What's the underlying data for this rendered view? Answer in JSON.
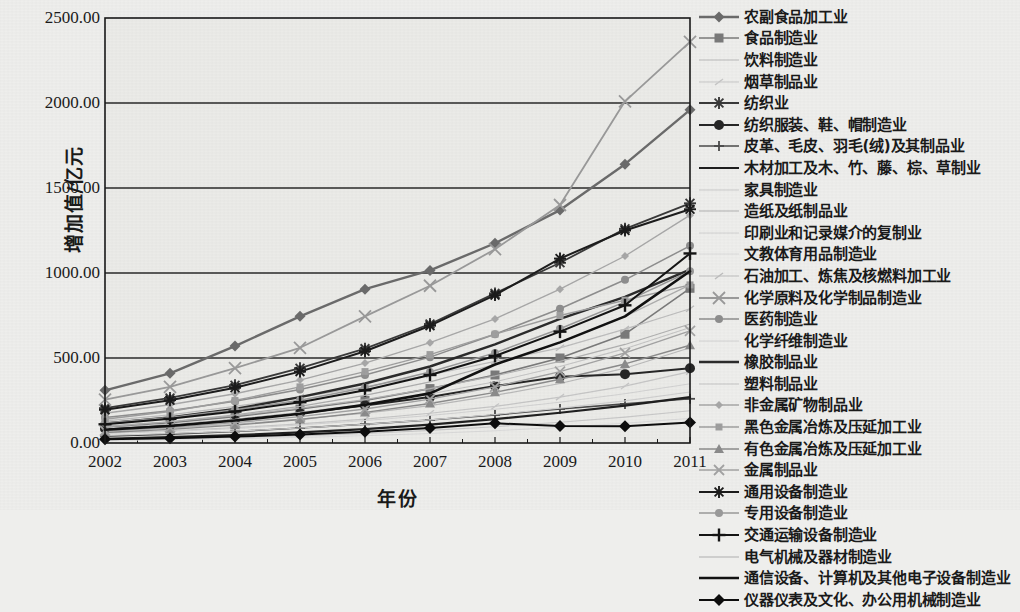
{
  "chart_data": {
    "type": "line",
    "title": "",
    "xlabel": "年份",
    "ylabel": "增加值/亿元",
    "grid": true,
    "legend_position": "right",
    "x": [
      "2002",
      "2003",
      "2004",
      "2005",
      "2006",
      "2007",
      "2008",
      "2009",
      "2010",
      "2011"
    ],
    "categories": [
      "2002",
      "2003",
      "2004",
      "2005",
      "2006",
      "2007",
      "2008",
      "2009",
      "2010",
      "2011"
    ],
    "xtick_labels": [
      "2002",
      "2003",
      "2004",
      "2005",
      "2006",
      "2007",
      "2008",
      "2009",
      "2010",
      "2011"
    ],
    "ytick_labels": [
      "0.00",
      "500.00",
      "1000.00",
      "1500.00",
      "2000.00",
      "2500.00"
    ],
    "ylim": [
      0,
      2500
    ],
    "ytick_values": [
      0,
      500,
      1000,
      1500,
      2000,
      2500
    ],
    "series": [
      {
        "name": "农副食品加工业",
        "marker": "diamond",
        "color": "#6b6b6b",
        "width": 2.4,
        "values": [
          310,
          410,
          570,
          745,
          905,
          1015,
          1175,
          1370,
          1640,
          1960
        ]
      },
      {
        "name": "食品制造业",
        "marker": "square",
        "color": "#7a7a7a",
        "width": 1.6,
        "values": [
          95,
          120,
          155,
          200,
          250,
          320,
          400,
          500,
          640,
          910
        ]
      },
      {
        "name": "饮料制造业",
        "marker": "none",
        "color": "#b9b9b9",
        "width": 1.2,
        "values": [
          70,
          88,
          110,
          140,
          175,
          220,
          280,
          350,
          440,
          560
        ]
      },
      {
        "name": "烟草制品业",
        "marker": "tick",
        "color": "#c6c6c6",
        "width": 1.2,
        "values": [
          60,
          72,
          90,
          112,
          140,
          175,
          215,
          270,
          335,
          420
        ]
      },
      {
        "name": "纺织业",
        "marker": "asterisk",
        "color": "#3a3a3a",
        "width": 1.8,
        "values": [
          205,
          265,
          340,
          440,
          555,
          700,
          880,
          1060,
          1260,
          1410
        ]
      },
      {
        "name": "纺织服装、鞋、帽制造业",
        "marker": "circle",
        "color": "#262626",
        "width": 2.0,
        "values": [
          85,
          105,
          135,
          175,
          220,
          270,
          335,
          390,
          405,
          440
        ]
      },
      {
        "name": "皮革、毛皮、羽毛(绒)及其制品业",
        "marker": "plus",
        "color": "#4a4a4a",
        "width": 1.6,
        "values": [
          40,
          52,
          68,
          88,
          110,
          135,
          165,
          200,
          230,
          260
        ]
      },
      {
        "name": "木材加工及木、竹、藤、棕、草制业",
        "marker": "none",
        "color": "#1f1f1f",
        "width": 2.2,
        "values": [
          25,
          34,
          46,
          62,
          82,
          108,
          140,
          178,
          220,
          270
        ]
      },
      {
        "name": "家具制造业",
        "marker": "none",
        "color": "#c9c9c9",
        "width": 1.1,
        "values": [
          18,
          24,
          32,
          42,
          56,
          74,
          96,
          122,
          152,
          190
        ]
      },
      {
        "name": "造纸及纸制品业",
        "marker": "none",
        "color": "#b0b0b0",
        "width": 1.1,
        "values": [
          100,
          125,
          160,
          205,
          255,
          320,
          395,
          480,
          580,
          700
        ]
      },
      {
        "name": "印刷业和记录媒介的复制业",
        "marker": "none",
        "color": "#cfcfcf",
        "width": 1.1,
        "values": [
          45,
          56,
          70,
          88,
          110,
          136,
          168,
          205,
          248,
          300
        ]
      },
      {
        "name": "文教体育用品制造业",
        "marker": "none",
        "color": "#dadada",
        "width": 1.0,
        "values": [
          15,
          19,
          25,
          33,
          43,
          56,
          72,
          92,
          116,
          145
        ]
      },
      {
        "name": "石油加工、炼焦及核燃料加工业",
        "marker": "tick",
        "color": "#bdbdbd",
        "width": 1.2,
        "values": [
          130,
          165,
          215,
          270,
          330,
          400,
          480,
          560,
          670,
          790
        ]
      },
      {
        "name": "化学原料及化学制品制造业",
        "marker": "cross",
        "color": "#9a9a9a",
        "width": 1.8,
        "values": [
          255,
          330,
          440,
          560,
          745,
          925,
          1140,
          1400,
          2010,
          2360
        ]
      },
      {
        "name": "医药制造业",
        "marker": "circle-sm",
        "color": "#8e8e8e",
        "width": 1.5,
        "values": [
          150,
          190,
          245,
          315,
          400,
          505,
          640,
          790,
          960,
          1160
        ]
      },
      {
        "name": "化学纤维制造业",
        "marker": "none",
        "color": "#d2d2d2",
        "width": 1.0,
        "values": [
          55,
          68,
          85,
          106,
          132,
          162,
          198,
          240,
          290,
          348
        ]
      },
      {
        "name": "橡胶制品业",
        "marker": "none",
        "color": "#2b2b2b",
        "width": 2.4,
        "values": [
          115,
          150,
          200,
          270,
          350,
          450,
          580,
          730,
          860,
          1020
        ]
      },
      {
        "name": "塑料制品业",
        "marker": "none",
        "color": "#c4c4c4",
        "width": 1.1,
        "values": [
          88,
          110,
          140,
          180,
          228,
          288,
          360,
          450,
          555,
          680
        ]
      },
      {
        "name": "非金属矿物制品业",
        "marker": "diamond-sm",
        "color": "#a8a8a8",
        "width": 1.4,
        "values": [
          175,
          225,
          290,
          370,
          470,
          590,
          730,
          905,
          1100,
          1340
        ]
      },
      {
        "name": "黑色金属冶炼及压延加工业",
        "marker": "square-sm",
        "color": "#9f9f9f",
        "width": 1.4,
        "values": [
          140,
          185,
          250,
          330,
          420,
          520,
          640,
          750,
          840,
          930
        ]
      },
      {
        "name": "有色金属冶炼及压延加工业",
        "marker": "triangle",
        "color": "#8b8b8b",
        "width": 1.4,
        "values": [
          62,
          80,
          105,
          138,
          180,
          232,
          298,
          375,
          465,
          575
        ]
      },
      {
        "name": "金属制品业",
        "marker": "x",
        "color": "#a3a3a3",
        "width": 1.4,
        "values": [
          72,
          92,
          120,
          155,
          200,
          258,
          330,
          420,
          530,
          660
        ]
      },
      {
        "name": "通用设备制造业",
        "marker": "asterisk",
        "color": "#1c1c1c",
        "width": 2.0,
        "values": [
          195,
          252,
          325,
          420,
          540,
          690,
          870,
          1085,
          1250,
          1375
        ]
      },
      {
        "name": "专用设备制造业",
        "marker": "circle-sm",
        "color": "#999999",
        "width": 1.5,
        "values": [
          118,
          150,
          195,
          252,
          325,
          418,
          530,
          672,
          830,
          1010
        ]
      },
      {
        "name": "交通运输设备制造业",
        "marker": "plus-lg",
        "color": "#141414",
        "width": 2.0,
        "values": [
          110,
          142,
          185,
          240,
          310,
          400,
          512,
          655,
          810,
          1115
        ]
      },
      {
        "name": "电气机械及器材制造业",
        "marker": "none",
        "color": "#adadad",
        "width": 1.2,
        "values": [
          95,
          125,
          165,
          215,
          280,
          360,
          462,
          592,
          745,
          930
        ]
      },
      {
        "name": "通信设备、计算机及其他电子设备制造业",
        "marker": "none",
        "color": "#111111",
        "width": 2.6,
        "values": [
          78,
          100,
          132,
          172,
          225,
          292,
          462,
          592,
          745,
          1010
        ]
      },
      {
        "name": "仪器仪表及文化、办公用机械制造业",
        "marker": "diamond-lg",
        "color": "#0d0d0d",
        "width": 2.0,
        "values": [
          22,
          28,
          38,
          50,
          66,
          88,
          116,
          100,
          98,
          120
        ]
      }
    ]
  },
  "legend": {
    "items": [
      {
        "label": "农副食品加工业",
        "key": "diamond"
      },
      {
        "label": "食品制造业",
        "key": "square"
      },
      {
        "label": "饮料制造业",
        "key": "none"
      },
      {
        "label": "烟草制品业",
        "key": "tick"
      },
      {
        "label": "纺织业",
        "key": "asterisk"
      },
      {
        "label": "纺织服装、鞋、帽制造业",
        "key": "circle"
      },
      {
        "label": "皮革、毛皮、羽毛(绒)及其制品业",
        "key": "plus"
      },
      {
        "label": "木材加工及木、竹、藤、棕、草制业",
        "key": "none"
      },
      {
        "label": "家具制造业",
        "key": "none"
      },
      {
        "label": "造纸及纸制品业",
        "key": "none"
      },
      {
        "label": "印刷业和记录媒介的复制业",
        "key": "none"
      },
      {
        "label": "文教体育用品制造业",
        "key": "none"
      },
      {
        "label": "石油加工、炼焦及核燃料加工业",
        "key": "tick"
      },
      {
        "label": "化学原料及化学制品制造业",
        "key": "cross"
      },
      {
        "label": "医药制造业",
        "key": "circle-sm"
      },
      {
        "label": "化学纤维制造业",
        "key": "none"
      },
      {
        "label": "橡胶制品业",
        "key": "none"
      },
      {
        "label": "塑料制品业",
        "key": "none"
      },
      {
        "label": "非金属矿物制品业",
        "key": "diamond-sm"
      },
      {
        "label": "黑色金属冶炼及压延加工业",
        "key": "square-sm"
      },
      {
        "label": "有色金属冶炼及压延加工业",
        "key": "triangle"
      },
      {
        "label": "金属制品业",
        "key": "x"
      },
      {
        "label": "通用设备制造业",
        "key": "asterisk"
      },
      {
        "label": "专用设备制造业",
        "key": "circle-sm"
      },
      {
        "label": "交通运输设备制造业",
        "key": "plus-lg"
      },
      {
        "label": "电气机械及器材制造业",
        "key": "none"
      },
      {
        "label": "通信设备、计算机及其他电子设备制造业",
        "key": "none"
      },
      {
        "label": "仪器仪表及文化、办公用机械制造业",
        "key": "diamond-lg"
      }
    ]
  },
  "colors": {
    "background": "#eeeeec",
    "plot_background": "#ebebe8",
    "axis": "#1a1a1a",
    "gridline": "#2a2a2a"
  }
}
